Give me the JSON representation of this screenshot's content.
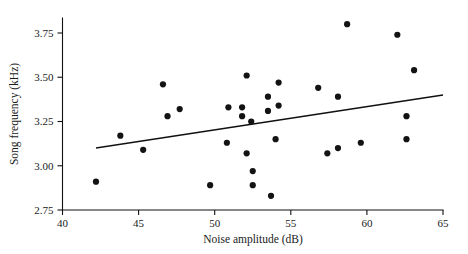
{
  "chart_data": {
    "type": "scatter",
    "title": "",
    "xlabel": "Noise amplitude (dB)",
    "ylabel": "Song frequency (kHz)",
    "xlim": [
      40,
      65
    ],
    "ylim": [
      2.75,
      3.75
    ],
    "xticks": [
      40,
      45,
      50,
      55,
      60,
      65
    ],
    "xtick_labels": [
      "40",
      "45",
      "50",
      "55",
      "60",
      "65"
    ],
    "yticks": [
      2.75,
      3.0,
      3.25,
      3.5,
      3.75
    ],
    "ytick_labels": [
      "2.75",
      "3.00",
      "3.25",
      "3.50",
      "3.75"
    ],
    "grid": false,
    "legend": null,
    "marker": "filled-circle",
    "marker_color": "#131313",
    "points": [
      {
        "x": 42.2,
        "y": 2.91
      },
      {
        "x": 43.8,
        "y": 3.17
      },
      {
        "x": 45.3,
        "y": 3.09
      },
      {
        "x": 46.6,
        "y": 3.46
      },
      {
        "x": 46.9,
        "y": 3.28
      },
      {
        "x": 47.7,
        "y": 3.32
      },
      {
        "x": 49.7,
        "y": 2.89
      },
      {
        "x": 50.9,
        "y": 3.33
      },
      {
        "x": 50.8,
        "y": 3.13
      },
      {
        "x": 51.8,
        "y": 3.33
      },
      {
        "x": 51.8,
        "y": 3.28
      },
      {
        "x": 52.1,
        "y": 3.51
      },
      {
        "x": 52.1,
        "y": 3.07
      },
      {
        "x": 52.4,
        "y": 3.25
      },
      {
        "x": 52.5,
        "y": 2.97
      },
      {
        "x": 52.5,
        "y": 2.89
      },
      {
        "x": 53.5,
        "y": 3.39
      },
      {
        "x": 53.5,
        "y": 3.31
      },
      {
        "x": 53.7,
        "y": 2.83
      },
      {
        "x": 54.0,
        "y": 3.15
      },
      {
        "x": 54.2,
        "y": 3.47
      },
      {
        "x": 54.2,
        "y": 3.34
      },
      {
        "x": 56.8,
        "y": 3.44
      },
      {
        "x": 57.4,
        "y": 3.07
      },
      {
        "x": 58.1,
        "y": 3.1
      },
      {
        "x": 58.1,
        "y": 3.39
      },
      {
        "x": 58.7,
        "y": 3.8
      },
      {
        "x": 59.6,
        "y": 3.13
      },
      {
        "x": 62.0,
        "y": 3.74
      },
      {
        "x": 62.6,
        "y": 3.28
      },
      {
        "x": 62.6,
        "y": 3.15
      },
      {
        "x": 63.1,
        "y": 3.54
      }
    ],
    "fit_line": {
      "type": "linear-regression",
      "x_start": 42.2,
      "y_start": 3.1,
      "x_end": 65.0,
      "y_end": 3.4
    }
  },
  "figure": {
    "marker_radius_px": 3.1
  }
}
